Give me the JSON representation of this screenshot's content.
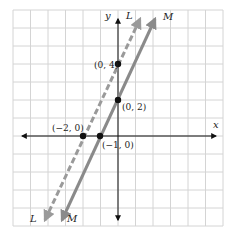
{
  "chart_data": {
    "type": "line",
    "title": "",
    "xlabel": "x",
    "ylabel": "y",
    "xlim": [
      -6,
      6
    ],
    "ylim": [
      -5,
      7
    ],
    "grid": true,
    "series": [
      {
        "name": "L",
        "style": "dashed",
        "color": "#999999",
        "equation": "y = 2x + 4",
        "points": [
          {
            "x": -2,
            "y": 0,
            "label": "(−2, 0)"
          },
          {
            "x": 0,
            "y": 4,
            "label": "(0, 4)"
          }
        ]
      },
      {
        "name": "M",
        "style": "solid",
        "color": "#8c8c8c",
        "equation": "y = 2x + 2",
        "points": [
          {
            "x": -1,
            "y": 0,
            "label": "(−1, 0)"
          },
          {
            "x": 0,
            "y": 2,
            "label": "(0, 2)"
          }
        ]
      }
    ]
  },
  "labels": {
    "x_axis": "x",
    "y_axis": "y",
    "line_L_top": "L",
    "line_M_top": "M",
    "line_L_bottom": "L",
    "line_M_bottom": "M",
    "pt_L_yint": "(0, 4)",
    "pt_M_yint": "(0, 2)",
    "pt_L_xint": "(−2, 0)",
    "pt_M_xint": "(−1, 0)"
  },
  "colors": {
    "grid": "#d4d4d4",
    "axis": "#111111",
    "line_L": "#9a9a9a",
    "line_M": "#8a8a8a",
    "point": "#111111"
  }
}
